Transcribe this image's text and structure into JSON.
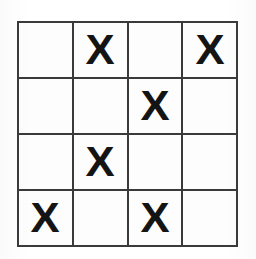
{
  "figure": {
    "kind": "grid-puzzle",
    "rows": 4,
    "columns": 4,
    "mark_glyph": "X",
    "empty_glyph": "",
    "colors": {
      "background": "#ffffff",
      "cell_fill": "#fdfdfd",
      "grid_line": "#3a3a3a",
      "mark": "#141414"
    },
    "counts": {
      "marked_cells": 6,
      "empty_cells": 10
    }
  },
  "grid": {
    "cells": [
      {
        "row": 1,
        "col": 1,
        "value": ""
      },
      {
        "row": 1,
        "col": 2,
        "value": "X"
      },
      {
        "row": 1,
        "col": 3,
        "value": ""
      },
      {
        "row": 1,
        "col": 4,
        "value": "X"
      },
      {
        "row": 2,
        "col": 1,
        "value": ""
      },
      {
        "row": 2,
        "col": 2,
        "value": ""
      },
      {
        "row": 2,
        "col": 3,
        "value": "X"
      },
      {
        "row": 2,
        "col": 4,
        "value": ""
      },
      {
        "row": 3,
        "col": 1,
        "value": ""
      },
      {
        "row": 3,
        "col": 2,
        "value": "X"
      },
      {
        "row": 3,
        "col": 3,
        "value": ""
      },
      {
        "row": 3,
        "col": 4,
        "value": ""
      },
      {
        "row": 4,
        "col": 1,
        "value": "X"
      },
      {
        "row": 4,
        "col": 2,
        "value": ""
      },
      {
        "row": 4,
        "col": 3,
        "value": "X"
      },
      {
        "row": 4,
        "col": 4,
        "value": ""
      }
    ]
  }
}
